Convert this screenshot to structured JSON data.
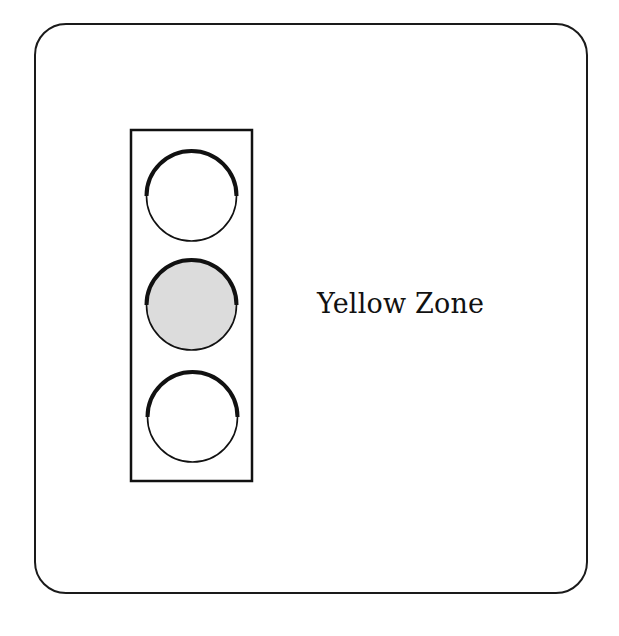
{
  "diagram": {
    "type": "traffic-light-indicator",
    "active_light_index": 1,
    "lights": [
      {
        "position": "top",
        "active": false,
        "fill": "#ffffff"
      },
      {
        "position": "middle",
        "active": true,
        "fill": "#dcdcdc"
      },
      {
        "position": "bottom",
        "active": false,
        "fill": "#ffffff"
      }
    ],
    "label": "Yellow Zone"
  },
  "colors": {
    "stroke": "#111111",
    "active_fill": "#dcdcdc",
    "inactive_fill": "#ffffff",
    "background": "#ffffff"
  }
}
